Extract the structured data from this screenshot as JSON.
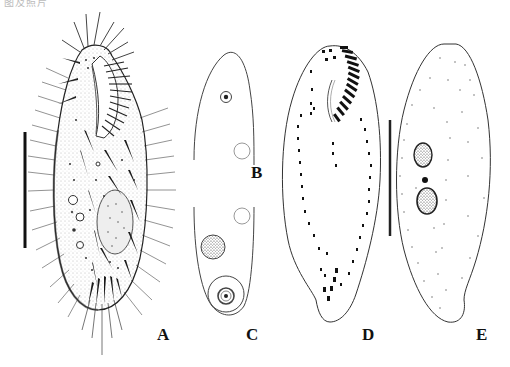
{
  "figure": {
    "caption_fragment": "图及照片",
    "panels": [
      {
        "id": "A",
        "label": "A",
        "description": "Ventral view of ciliate with cirri, adoral zone of membranelles and macronucleus"
      },
      {
        "id": "B",
        "label": "B",
        "description": "Anterior portion outline with vacuoles"
      },
      {
        "id": "C",
        "label": "C",
        "description": "Posterior portion outline with nuclei"
      },
      {
        "id": "D",
        "label": "D",
        "description": "Infraciliature, ventral view"
      },
      {
        "id": "E",
        "label": "E",
        "description": "Dorsal view with macronuclear nodules and micronucleus"
      }
    ],
    "scale_bars": [
      {
        "panel": "A",
        "orientation": "vertical"
      },
      {
        "panel": "D-E",
        "orientation": "vertical"
      }
    ],
    "colors": {
      "ink": "#111111",
      "background": "#ffffff",
      "stipple": "#666666"
    }
  }
}
